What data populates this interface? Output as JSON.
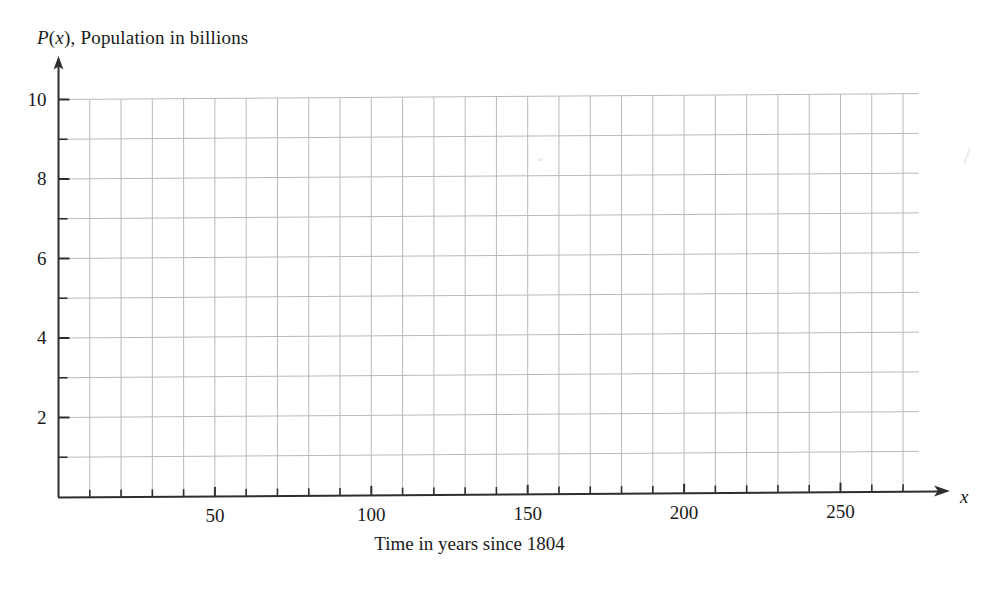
{
  "chart_data": {
    "type": "line",
    "title": "P(x), Population in billions",
    "title_parts": {
      "p": "P",
      "paren_open": "(",
      "x": "x",
      "paren_close": ")",
      "rest": ", Population in billions"
    },
    "xlabel": "Time in years since 1804",
    "x_axis_variable": "x",
    "ylabel": "P(x), Population in billions",
    "xlim": [
      0,
      275
    ],
    "ylim": [
      0,
      10.4
    ],
    "x_major_tick_labels": [
      "50",
      "100",
      "150",
      "200",
      "250"
    ],
    "x_major_tick_values": [
      50,
      100,
      150,
      200,
      250
    ],
    "x_tick_interval": 10,
    "x_tick_values": [
      10,
      20,
      30,
      40,
      50,
      60,
      70,
      80,
      90,
      100,
      110,
      120,
      130,
      140,
      150,
      160,
      170,
      180,
      190,
      200,
      210,
      220,
      230,
      240,
      250,
      260,
      270
    ],
    "y_major_tick_labels": [
      "2",
      "4",
      "6",
      "8",
      "10"
    ],
    "y_major_tick_values": [
      2,
      4,
      6,
      8,
      10
    ],
    "y_tick_interval": 1,
    "y_tick_values": [
      1,
      2,
      3,
      4,
      5,
      6,
      7,
      8,
      9,
      10
    ],
    "grid": true,
    "grid_x_interval": 10,
    "grid_y_interval": 1,
    "grid_color": "#b9b9bd",
    "axis_color": "#333333",
    "legend": null,
    "series": [],
    "values": [],
    "categories": [],
    "annotations": [],
    "note": "Blank coordinate grid provided for plotting; no data plotted."
  },
  "figure": {
    "background_color": "#ffffff",
    "axis_arrow_x": true,
    "axis_arrow_y": true
  }
}
